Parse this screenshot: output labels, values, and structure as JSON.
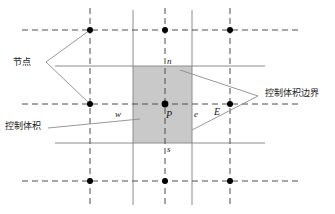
{
  "figure": {
    "type": "finite-volume-grid-diagram",
    "background": "#ffffff",
    "shading_color": "#c9c9c9",
    "line_color": "#8c8c8c",
    "node_color": "#000000",
    "label_color": "#1a1a1a"
  },
  "annotations": {
    "node_label": "节点",
    "control_volume_label": "控制体积",
    "cv_boundary_label": "控制体积边界"
  },
  "point_labels": {
    "north": "n",
    "south": "s",
    "west": "w",
    "east": "e",
    "center": "P",
    "east_node": "E"
  },
  "grid": {
    "dashed_vertical_x": [
      90,
      165,
      230
    ],
    "dashed_horizontal_y": [
      30,
      104,
      181
    ],
    "solid_vertical_x": [
      127,
      192
    ],
    "solid_horizontal_y": [
      66,
      143
    ],
    "nodes": [
      {
        "x": 90,
        "y": 30
      },
      {
        "x": 165,
        "y": 30
      },
      {
        "x": 230,
        "y": 30
      },
      {
        "x": 90,
        "y": 104
      },
      {
        "x": 165,
        "y": 104
      },
      {
        "x": 230,
        "y": 104
      },
      {
        "x": 90,
        "y": 181
      },
      {
        "x": 165,
        "y": 181
      },
      {
        "x": 230,
        "y": 181
      }
    ]
  },
  "control_volume": {
    "x": 133,
    "y": 66,
    "width": 59,
    "height": 77
  }
}
